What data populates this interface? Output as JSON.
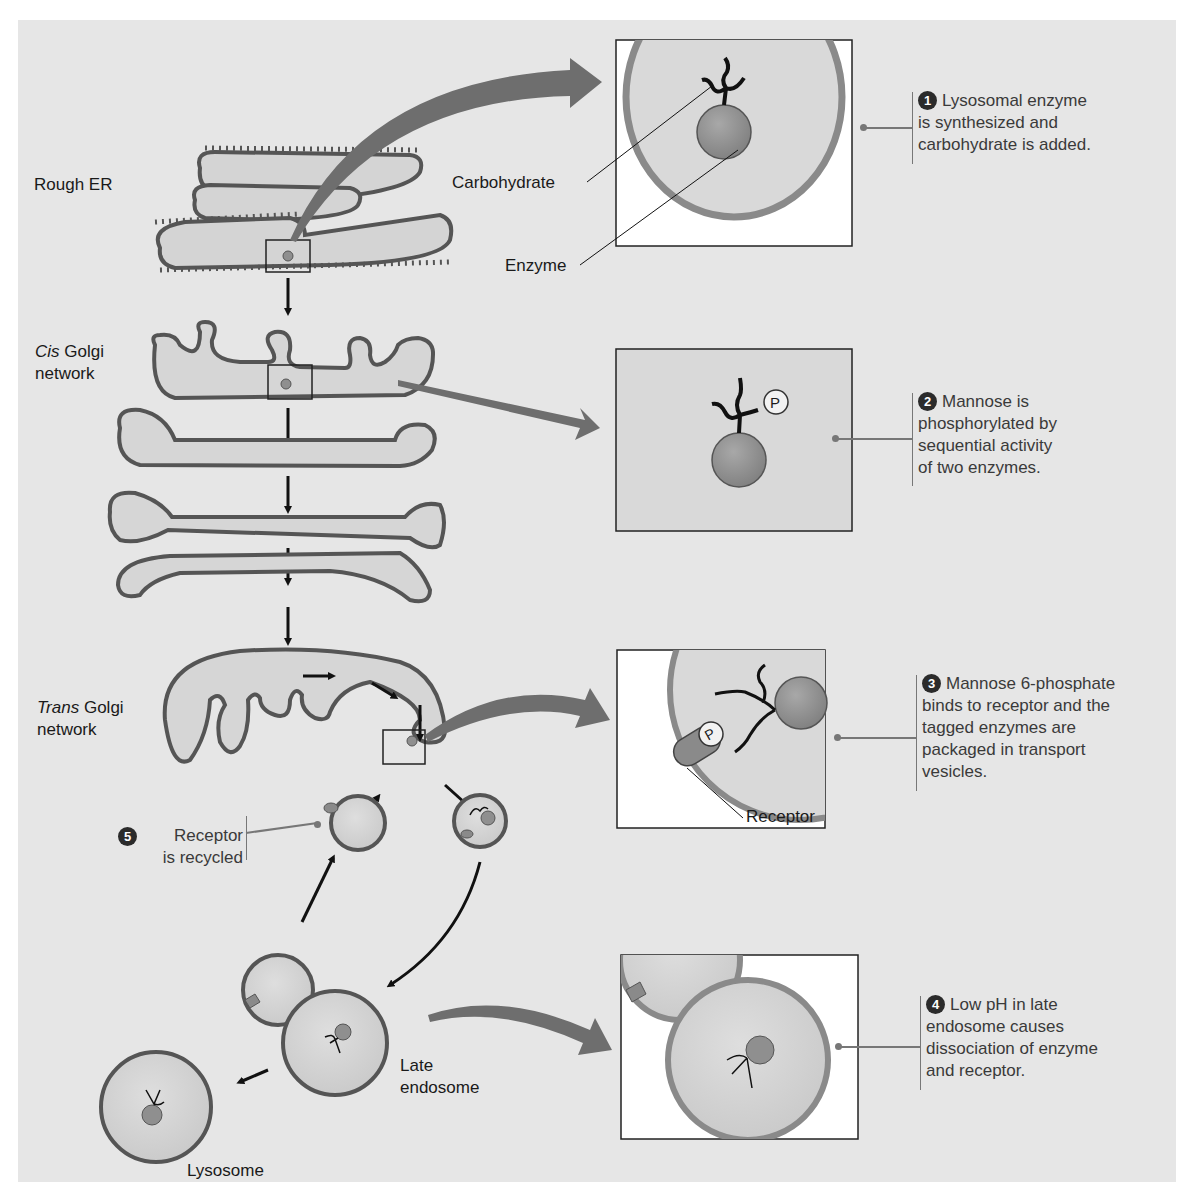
{
  "figure": {
    "colors": {
      "background": "#e6e6e6",
      "membrane": "#8a8a8a",
      "lumen": "#d8d8d8",
      "enzyme": "#8f8f8f",
      "arrow": "#111111",
      "zoom_arrow": "#6e6e6e",
      "text": "#1a1a1a",
      "step_text": "#3a3a3a"
    }
  },
  "labels": {
    "rough_er": "Rough ER",
    "cis_golgi_italic": "Cis",
    "cis_golgi_rest": " Golgi",
    "cis_golgi_line2": "network",
    "trans_golgi_italic": "Trans",
    "trans_golgi_rest": " Golgi",
    "trans_golgi_line2": "network",
    "late_endosome_line1": "Late",
    "late_endosome_line2": "endosome",
    "lysosome": "Lysosome",
    "carbohydrate": "Carbohydrate",
    "enzyme": "Enzyme",
    "receptor": "Receptor",
    "phosphate": "P"
  },
  "steps": [
    {
      "number": "1",
      "lines": [
        "Lysosomal enzyme",
        "is synthesized and",
        "carbohydrate is added."
      ]
    },
    {
      "number": "2",
      "lines": [
        "Mannose is",
        "phosphorylated by",
        "sequential activity",
        "of two enzymes."
      ]
    },
    {
      "number": "3",
      "lines": [
        "Mannose 6-phosphate",
        "binds to receptor and the",
        "tagged enzymes are",
        "packaged in transport",
        "vesicles."
      ]
    },
    {
      "number": "4",
      "lines": [
        "Low pH in late",
        "endosome causes",
        "dissociation of enzyme",
        "and receptor."
      ]
    },
    {
      "number": "5",
      "lines": [
        "Receptor",
        "is recycled"
      ]
    }
  ]
}
